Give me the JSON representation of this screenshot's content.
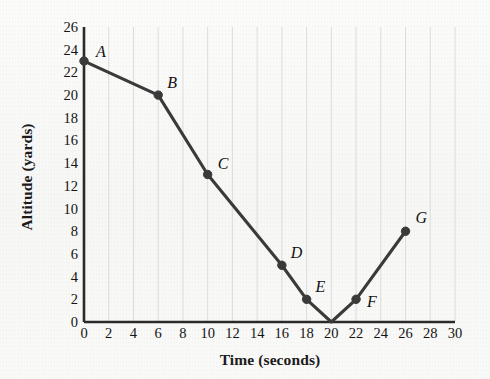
{
  "chart_data": {
    "type": "line",
    "title": "",
    "xlabel": "Time (seconds)",
    "ylabel": "Altitude (yards)",
    "xlim": [
      0,
      30
    ],
    "ylim": [
      0,
      26
    ],
    "xticks": [
      0,
      2,
      4,
      6,
      8,
      10,
      12,
      14,
      16,
      18,
      20,
      22,
      24,
      26,
      28,
      30
    ],
    "yticks": [
      0,
      2,
      4,
      6,
      8,
      10,
      12,
      14,
      16,
      18,
      20,
      22,
      24,
      26
    ],
    "grid": "vertical-only",
    "legend": "none",
    "line_color": "#3a3a3a",
    "marker_color": "#3a3a3a",
    "x": [
      0,
      6,
      10,
      16,
      18,
      20,
      22,
      26
    ],
    "y": [
      23,
      20,
      13,
      5,
      2,
      0,
      2,
      8
    ],
    "markers_shown": [
      true,
      true,
      true,
      true,
      true,
      false,
      true,
      true
    ],
    "points": [
      {
        "label": "A",
        "x": 0,
        "y": 23,
        "label_dx": 12,
        "label_dy": -17
      },
      {
        "label": "B",
        "x": 6,
        "y": 20,
        "label_dx": 9,
        "label_dy": -20
      },
      {
        "label": "C",
        "x": 10,
        "y": 13,
        "label_dx": 10,
        "label_dy": -19
      },
      {
        "label": "D",
        "x": 16,
        "y": 5,
        "label_dx": 9,
        "label_dy": -20
      },
      {
        "label": "E",
        "x": 18,
        "y": 2,
        "label_dx": 9,
        "label_dy": -20
      },
      {
        "label": "F",
        "x": 22,
        "y": 2,
        "label_dx": 11,
        "label_dy": -5
      },
      {
        "label": "G",
        "x": 26,
        "y": 8,
        "label_dx": 10,
        "label_dy": -21
      }
    ],
    "vertex_unlabeled": {
      "x": 20,
      "y": 0
    }
  }
}
